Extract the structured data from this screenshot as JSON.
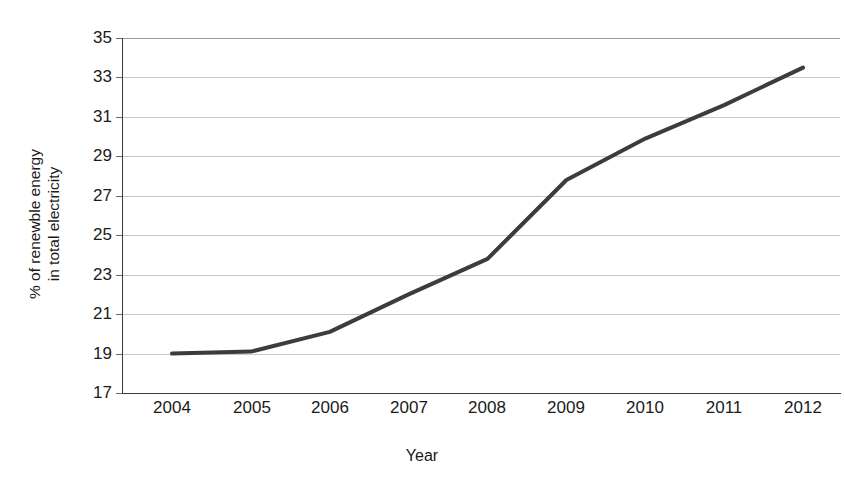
{
  "top_caption": "",
  "chart_data": {
    "type": "line",
    "title": "",
    "xlabel": "Year",
    "ylabel": "% of renewble energy\nin total electricity",
    "ylabel_line1": "% of renewble energy",
    "ylabel_line2": "in total electricity",
    "categories": [
      "2004",
      "2005",
      "2006",
      "2007",
      "2008",
      "2009",
      "2010",
      "2011",
      "2012"
    ],
    "x": [
      2004,
      2005,
      2006,
      2007,
      2008,
      2009,
      2010,
      2011,
      2012
    ],
    "values": [
      19.0,
      19.1,
      20.1,
      22.0,
      23.8,
      27.8,
      29.9,
      31.6,
      33.5
    ],
    "series": [
      {
        "name": "% of renewble energy in total electricity",
        "values": [
          19.0,
          19.1,
          20.1,
          22.0,
          23.8,
          27.8,
          29.9,
          31.6,
          33.5
        ],
        "color": "#3c3c3c"
      }
    ],
    "ylim": [
      17,
      35
    ],
    "yticks": [
      35,
      33,
      31,
      29,
      27,
      25,
      23,
      21,
      19,
      17
    ],
    "ytick_labels": [
      "35",
      "33",
      "31",
      "29",
      "27",
      "25",
      "23",
      "21",
      "19",
      "17"
    ],
    "xlim": [
      2004,
      2012
    ],
    "grid": true,
    "grid_axis": "y",
    "grid_color": "#c8c8c8",
    "legend": false,
    "legend_position": "none",
    "markers": false,
    "line_width": 4,
    "line_color": "#3c3c3c",
    "background_color": "#ffffff",
    "axis_color": "#3a3a3a"
  }
}
